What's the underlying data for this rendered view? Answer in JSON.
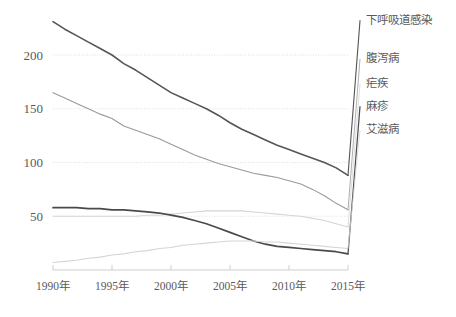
{
  "chart_data": {
    "type": "line",
    "title": "",
    "subtitle": "",
    "xlabel": "",
    "ylabel": "",
    "xlim": [
      1990,
      2015
    ],
    "ylim": [
      0,
      240
    ],
    "grid": true,
    "legend_position": "right",
    "y_ticks": [
      50,
      100,
      150,
      200
    ],
    "y_tick_labels": [
      "50",
      "100",
      "150",
      "200"
    ],
    "x_ticks": [
      1990,
      1995,
      2000,
      2005,
      2010,
      2015
    ],
    "x_tick_labels": [
      "1990年",
      "1995年",
      "2000年",
      "2005年",
      "2010年",
      "2015年"
    ],
    "x": [
      1990,
      1991,
      1992,
      1993,
      1994,
      1995,
      1996,
      1997,
      1998,
      1999,
      2000,
      2001,
      2002,
      2003,
      2004,
      2005,
      2006,
      2007,
      2008,
      2009,
      2010,
      2011,
      2012,
      2013,
      2014,
      2015
    ],
    "series": [
      {
        "name": "下呼吸道感染",
        "color": "#555555",
        "width": 1.6,
        "label_y": 232,
        "values": [
          231,
          224,
          218,
          212,
          206,
          200,
          192,
          186,
          179,
          172,
          165,
          160,
          155,
          150,
          144,
          137,
          131,
          126,
          121,
          116,
          112,
          108,
          104,
          100,
          95,
          88
        ]
      },
      {
        "name": "腹泻病",
        "color": "#9a9a9a",
        "width": 1.1,
        "label_y": 196,
        "values": [
          165,
          160,
          155,
          150,
          145,
          141,
          134,
          130,
          126,
          122,
          117,
          112,
          107,
          103,
          99,
          96,
          93,
          90,
          88,
          86,
          83,
          80,
          75,
          69,
          62,
          56
        ]
      },
      {
        "name": "疟疾",
        "color": "#d5d5d5",
        "width": 1.1,
        "label_y": 173,
        "values": [
          50,
          50,
          50,
          50,
          50,
          50,
          50,
          50,
          51,
          51,
          52,
          53,
          54,
          55,
          55,
          55,
          55,
          54,
          53,
          52,
          51,
          50,
          48,
          46,
          43,
          40
        ]
      },
      {
        "name": "麻疹",
        "color": "#4a4a4a",
        "width": 1.7,
        "label_y": 152,
        "values": [
          58,
          58,
          58,
          57,
          57,
          56,
          56,
          55,
          54,
          53,
          51,
          49,
          46,
          43,
          39,
          35,
          31,
          27,
          24,
          22,
          21,
          20,
          19,
          18,
          17,
          15
        ]
      },
      {
        "name": "艾滋病",
        "color": "#d5d5d5",
        "width": 1.1,
        "label_y": 130,
        "values": [
          7,
          8,
          9,
          11,
          12,
          14,
          15,
          17,
          18,
          20,
          21,
          23,
          24,
          25,
          26,
          27,
          27,
          27,
          26,
          26,
          25,
          24,
          23,
          22,
          21,
          20
        ]
      }
    ]
  },
  "legend": {
    "items": [
      {
        "label": "下呼吸道感染"
      },
      {
        "label": "腹泻病"
      },
      {
        "label": "疟疾"
      },
      {
        "label": "麻疹"
      },
      {
        "label": "艾滋病"
      }
    ]
  },
  "axes": {
    "y_labels": [
      "200",
      "150",
      "100",
      "50"
    ],
    "x_labels": [
      "1990年",
      "1995年",
      "2000年",
      "2005年",
      "2010年",
      "2015年"
    ]
  }
}
